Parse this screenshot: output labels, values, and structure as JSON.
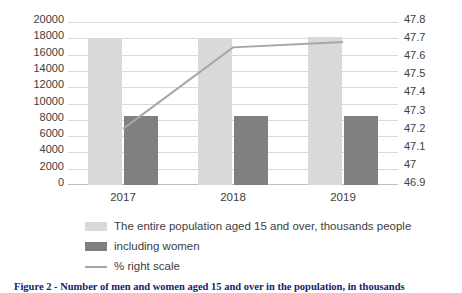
{
  "chart_data": {
    "type": "bar",
    "title": "",
    "xlabel": "",
    "ylabel": "",
    "categories": [
      "2017",
      "2018",
      "2019"
    ],
    "grid": true,
    "legend_position": "bottom",
    "y_left": {
      "min": 0,
      "max": 20000,
      "step": 2000,
      "ticks": [
        "20000",
        "18000",
        "16000",
        "14000",
        "12000",
        "10000",
        "8000",
        "6000",
        "4000",
        "2000",
        "0"
      ]
    },
    "y_right": {
      "min": 46.9,
      "max": 47.8,
      "step": 0.1,
      "ticks": [
        "47.8",
        "47.7",
        "47.6",
        "47.5",
        "47.4",
        "47.3",
        "47.2",
        "47.1",
        "47",
        "46.9"
      ]
    },
    "series": [
      {
        "name": "The entire population aged 15 and over, thousands people",
        "type": "bar",
        "axis": "left",
        "color": "#d9d9d9",
        "values": [
          17900,
          18100,
          18150
        ]
      },
      {
        "name": "including women",
        "type": "bar",
        "axis": "left",
        "color": "#808080",
        "values": [
          8450,
          8450,
          8500
        ]
      },
      {
        "name": "% right scale",
        "type": "line",
        "axis": "right",
        "color": "#a6a6a6",
        "values": [
          47.21,
          47.66,
          47.69
        ]
      }
    ]
  },
  "legend": {
    "items": [
      {
        "label": "The entire population aged 15 and over, thousands people",
        "swatch": "total"
      },
      {
        "label": "including women",
        "swatch": "women"
      },
      {
        "label": "% right scale",
        "swatch": "line"
      }
    ]
  },
  "caption": {
    "text": "Figure 2 - Number of men and women aged 15 and over in the population, in thousands"
  }
}
